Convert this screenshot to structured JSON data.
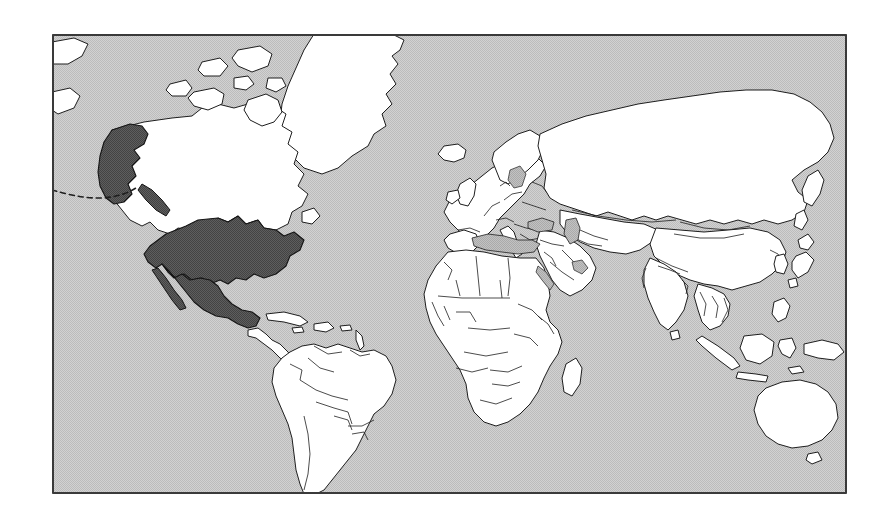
{
  "figure": {
    "kind": "world-map",
    "projection": "equirectangular",
    "frame": {
      "x": 52,
      "y": 34,
      "width": 795,
      "height": 460,
      "border_color": "#3a3a3a",
      "border_width_px": 2
    },
    "canvas": {
      "width": 887,
      "height": 527,
      "background_color": "#ffffff"
    }
  },
  "legend_semantics": {
    "highlighted_label": "Highlighted country",
    "unhighlighted_label": "Other country",
    "ocean_label": "Ocean",
    "sea_label": "Inland sea"
  },
  "colors": {
    "ocean": "#c9c9c9",
    "sea": "#b4b4b4",
    "land": "#ffffff",
    "land_stroke": "#1e1e1e",
    "highlight": "#555555",
    "highlight_stroke": "#141414",
    "frame": "#3a3a3a",
    "page": "#ffffff"
  },
  "highlighted_countries": [
    "United States of America",
    "Alaska",
    "Mexico"
  ],
  "unhighlighted_regions": [
    "Canada",
    "Greenland",
    "Iceland",
    "Central America",
    "Caribbean",
    "South America",
    "Europe",
    "Africa",
    "Russia",
    "Middle East",
    "India",
    "China",
    "Southeast Asia",
    "Japan",
    "Australia",
    "New Zealand"
  ],
  "shaded_seas": [
    "Mediterranean Sea",
    "Black Sea",
    "Caspian Sea",
    "Baltic Sea",
    "Persian Gulf",
    "Red Sea"
  ],
  "map_features": {
    "aleutian_chain_style": "dashed",
    "country_borders_visible": true,
    "graticule_visible": false,
    "labels_visible": false
  }
}
